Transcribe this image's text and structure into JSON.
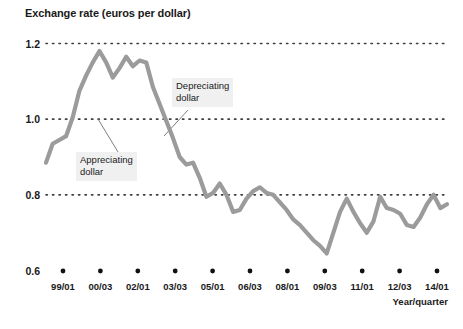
{
  "chart_data": {
    "type": "line",
    "title": "Exchange rate (euros per dollar)",
    "xlabel": "Year/quarter",
    "ylabel": "",
    "ylim": [
      0.6,
      1.2
    ],
    "yticks": [
      0.6,
      0.8,
      1.0,
      1.2
    ],
    "ytick_labels": [
      "0.6",
      "0.8",
      "1.0",
      "1.2"
    ],
    "grid": "horizontal-dotted",
    "legend": "none",
    "xtick_labels": [
      "99/01",
      "00/03",
      "02/01",
      "03/03",
      "05/01",
      "06/03",
      "08/01",
      "09/03",
      "11/01",
      "12/03",
      "14/01"
    ],
    "x": [
      "99/01",
      "99/02",
      "99/03",
      "99/04",
      "00/01",
      "00/02",
      "00/03",
      "00/04",
      "01/01",
      "01/02",
      "01/03",
      "01/04",
      "02/01",
      "02/02",
      "02/03",
      "02/04",
      "03/01",
      "03/02",
      "03/03",
      "03/04",
      "04/01",
      "04/02",
      "04/03",
      "04/04",
      "05/01",
      "05/02",
      "05/03",
      "05/04",
      "06/01",
      "06/02",
      "06/03",
      "06/04",
      "07/01",
      "07/02",
      "07/03",
      "07/04",
      "08/01",
      "08/02",
      "08/03",
      "08/04",
      "09/01",
      "09/02",
      "09/03",
      "09/04",
      "10/01",
      "10/02",
      "10/03",
      "10/04",
      "11/01",
      "11/02",
      "11/03",
      "11/04",
      "12/01",
      "12/02",
      "12/03",
      "12/04",
      "13/01",
      "13/02",
      "13/03",
      "13/04",
      "14/01"
    ],
    "values": [
      0.885,
      0.935,
      0.945,
      0.955,
      1.005,
      1.075,
      1.115,
      1.15,
      1.18,
      1.15,
      1.11,
      1.135,
      1.165,
      1.14,
      1.155,
      1.15,
      1.085,
      1.04,
      0.995,
      0.95,
      0.9,
      0.88,
      0.885,
      0.845,
      0.795,
      0.805,
      0.83,
      0.8,
      0.755,
      0.76,
      0.79,
      0.81,
      0.82,
      0.805,
      0.8,
      0.78,
      0.76,
      0.735,
      0.72,
      0.7,
      0.68,
      0.665,
      0.645,
      0.7,
      0.755,
      0.79,
      0.755,
      0.725,
      0.7,
      0.73,
      0.795,
      0.765,
      0.76,
      0.75,
      0.72,
      0.715,
      0.74,
      0.775,
      0.8,
      0.765,
      0.775
    ],
    "annotations": [
      {
        "id": "appreciating",
        "text_line1": "Appreciating",
        "text_line2": "dollar"
      },
      {
        "id": "depreciating",
        "text_line1": "Depreciating",
        "text_line2": "dollar"
      }
    ],
    "colors": {
      "line": "#9b9b9b",
      "grid": "#3d3d3d",
      "text": "#1a1a1a",
      "annotation_background": "#f0f0f0"
    }
  }
}
